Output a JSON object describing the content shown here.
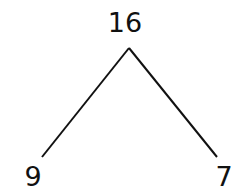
{
  "number_bond": {
    "whole": "16",
    "parts": [
      {
        "label": "9",
        "position": "left"
      },
      {
        "label": "7",
        "position": "right"
      }
    ]
  },
  "colors": {
    "line": "#111111",
    "text": "#111111",
    "background": "#ffffff"
  }
}
